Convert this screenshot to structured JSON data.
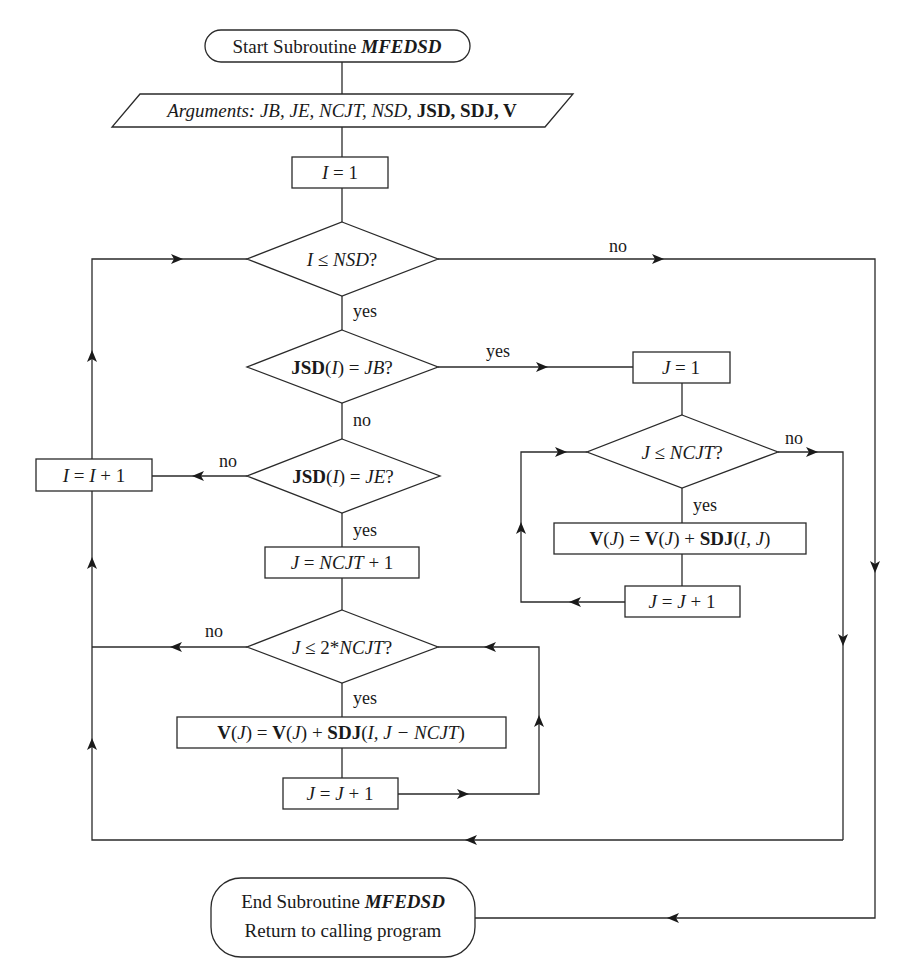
{
  "diagram": {
    "nodes": {
      "start": {
        "type": "terminal",
        "prefix": "Start Subroutine ",
        "name": "MFEDSD"
      },
      "args": {
        "type": "io",
        "label": "Arguments: ",
        "italic_args": "JB, JE, NCJT, NSD, ",
        "bold_args": "JSD, SDJ, V",
        "parts": [
          "Arguments:",
          "JB",
          "JE",
          "NCJT",
          "NSD",
          "JSD",
          "SDJ",
          "V"
        ]
      },
      "init_i": {
        "type": "process",
        "var": "I",
        "op": " = ",
        "val": "1"
      },
      "cond_i": {
        "type": "decision",
        "lhs": "I",
        "op": " ≤ ",
        "rhs": "NSD",
        "q": "?"
      },
      "cond_jb": {
        "type": "decision",
        "arr": "JSD",
        "idx": "I",
        "op": " = ",
        "rhs": "JB",
        "q": "?"
      },
      "cond_je": {
        "type": "decision",
        "arr": "JSD",
        "idx": "I",
        "op": " = ",
        "rhs": "JE",
        "q": "?"
      },
      "inc_i": {
        "type": "process",
        "lhs": "I",
        "op": " = ",
        "rhs": "I",
        "plus": " + 1"
      },
      "init_j1": {
        "type": "process",
        "var": "J",
        "op": " = ",
        "val": "1"
      },
      "cond_j1": {
        "type": "decision",
        "lhs": "J",
        "op": " ≤ ",
        "rhs": "NCJT",
        "q": "?"
      },
      "acc1": {
        "type": "process",
        "v": "V",
        "j": "J",
        "eq": " = ",
        "plus": " + ",
        "sdj": "SDJ",
        "args": "I, J"
      },
      "inc_j1": {
        "type": "process",
        "lhs": "J",
        "op": " = ",
        "rhs": "J",
        "plus": " + 1"
      },
      "init_j2": {
        "type": "process",
        "var": "J",
        "op": " = ",
        "rhs": "NCJT",
        "plus": " + 1"
      },
      "cond_j2": {
        "type": "decision",
        "lhs": "J",
        "op": " ≤ 2*",
        "rhs": "NCJT",
        "q": "?"
      },
      "acc2": {
        "type": "process",
        "v": "V",
        "j": "J",
        "eq": " = ",
        "plus": " + ",
        "sdj": "SDJ",
        "args": "I, J − NCJT"
      },
      "inc_j2": {
        "type": "process",
        "lhs": "J",
        "op": " = ",
        "rhs": "J",
        "plus": " + 1"
      },
      "end": {
        "type": "terminal",
        "prefix": "End Subroutine ",
        "name": "MFEDSD",
        "line2": "Return to calling program"
      }
    },
    "edge_labels": {
      "cond_i_no": "no",
      "cond_i_yes": "yes",
      "cond_jb_yes": "yes",
      "cond_jb_no": "no",
      "cond_je_no": "no",
      "cond_je_yes": "yes",
      "cond_j1_no": "no",
      "cond_j1_yes": "yes",
      "cond_j2_no": "no",
      "cond_j2_yes": "yes"
    },
    "colors": {
      "line": "#2a2a2a",
      "text": "#1a1a1a",
      "background": "#ffffff"
    }
  }
}
